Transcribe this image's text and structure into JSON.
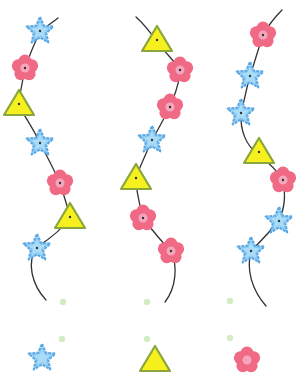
{
  "worksheet": {
    "type": "bead-pattern-puzzle",
    "colors": {
      "star_fill": "#a9dcf7",
      "star_stroke": "#5aa8e6",
      "flower_fill": "#f06a86",
      "flower_center": "#f4a6bd",
      "triangle_fill": "#f5f01e",
      "triangle_stroke": "#8aa63c",
      "string": "#333333",
      "dot": "#d4ecc4"
    },
    "strings": [
      {
        "id": "string-1",
        "path": "M58,18 C50,24 44,28 40,32 C32,48 28,60 25,68 C22,84 20,95 18,105 C26,118 34,130 40,143 C48,158 54,170 60,183 C64,196 68,208 70,217 C62,230 48,240 37,247 C26,262 32,285 46,300",
        "beads": [
          {
            "shape": "star",
            "x": 40,
            "y": 31
          },
          {
            "shape": "flower",
            "x": 25,
            "y": 68
          },
          {
            "shape": "triangle",
            "x": 19,
            "y": 104
          },
          {
            "shape": "star",
            "x": 40,
            "y": 143
          },
          {
            "shape": "flower",
            "x": 60,
            "y": 183
          },
          {
            "shape": "triangle",
            "x": 70,
            "y": 217
          },
          {
            "shape": "star",
            "x": 37,
            "y": 248
          }
        ],
        "dots": [
          {
            "x": 63,
            "y": 302
          },
          {
            "x": 62,
            "y": 339
          }
        ],
        "answer": {
          "shape": "star",
          "x": 42,
          "y": 358
        }
      },
      {
        "id": "string-2",
        "path": "M136,17 C144,24 150,32 156,40 C164,52 174,60 180,70 C180,84 174,96 170,107 C164,118 158,130 152,140 C146,154 140,166 136,178 C136,192 140,206 143,218 C152,230 162,242 171,251 C178,266 176,288 165,302",
        "beads": [
          {
            "shape": "triangle",
            "x": 157,
            "y": 40
          },
          {
            "shape": "flower",
            "x": 180,
            "y": 70
          },
          {
            "shape": "flower",
            "x": 170,
            "y": 107
          },
          {
            "shape": "star",
            "x": 152,
            "y": 140
          },
          {
            "shape": "triangle",
            "x": 136,
            "y": 178
          },
          {
            "shape": "flower",
            "x": 143,
            "y": 218
          },
          {
            "shape": "flower",
            "x": 171,
            "y": 251
          }
        ],
        "dots": [
          {
            "x": 147,
            "y": 302
          },
          {
            "x": 147,
            "y": 339
          }
        ],
        "answer": {
          "shape": "triangle",
          "x": 155,
          "y": 360
        }
      },
      {
        "id": "string-3",
        "path": "M282,10 C274,18 268,26 263,35 C258,50 254,64 250,76 C246,90 244,102 241,113 C240,130 246,146 258,154 C268,162 278,172 283,180 C286,196 284,210 279,220 C270,232 260,242 251,251 C246,270 252,290 266,306",
        "beads": [
          {
            "shape": "flower",
            "x": 263,
            "y": 35
          },
          {
            "shape": "star",
            "x": 250,
            "y": 76
          },
          {
            "shape": "star",
            "x": 241,
            "y": 113
          },
          {
            "shape": "triangle",
            "x": 259,
            "y": 152
          },
          {
            "shape": "flower",
            "x": 283,
            "y": 180
          },
          {
            "shape": "star",
            "x": 279,
            "y": 221
          },
          {
            "shape": "star",
            "x": 251,
            "y": 251
          }
        ],
        "dots": [
          {
            "x": 230,
            "y": 301
          },
          {
            "x": 230,
            "y": 338
          }
        ],
        "answer": {
          "shape": "flower",
          "x": 247,
          "y": 360
        }
      }
    ]
  }
}
